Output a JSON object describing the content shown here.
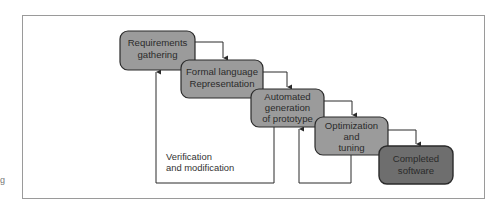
{
  "figure": {
    "margin_text": "g",
    "frame_color": "#9a9a9a",
    "box_fill": "#9b9b9b",
    "final_box_fill": "#6e6e6e",
    "stroke_color": "#2a2a2a",
    "steps": [
      {
        "id": "requirements",
        "lines": [
          "Requirements",
          "gathering"
        ]
      },
      {
        "id": "formal-language",
        "lines": [
          "Formal language",
          "Representation"
        ]
      },
      {
        "id": "automated-generation",
        "lines": [
          "Automated",
          "generation",
          "of prototype"
        ]
      },
      {
        "id": "optimization",
        "lines": [
          "Optimization",
          "and",
          "tuning"
        ]
      },
      {
        "id": "completed",
        "lines": [
          "Completed",
          "software"
        ]
      }
    ],
    "feedback_label": [
      "Verification",
      "and modification"
    ]
  }
}
